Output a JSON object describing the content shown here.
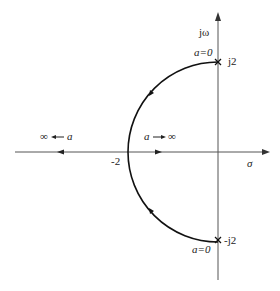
{
  "diagram": {
    "type": "root-locus",
    "axes": {
      "imag_label": "jω",
      "real_label": "σ"
    },
    "points": {
      "top_pole_label": "j2",
      "bottom_pole_label": "-j2",
      "breakaway_label": "-2"
    },
    "annotations": {
      "top_a0": "a=0",
      "bottom_a0": "a=0",
      "left_direction": "∞ ← a",
      "right_direction": "a → ∞"
    },
    "colors": {
      "axis": "#555555",
      "locus": "#111111",
      "text": "#222222"
    }
  }
}
